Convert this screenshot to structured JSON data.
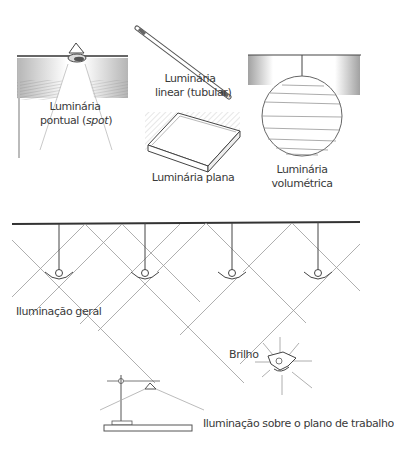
{
  "figure": {
    "type": "illustration"
  },
  "luminaires": [
    {
      "id": "spot",
      "line1": "Luminária",
      "line2_prefix": "pontual (",
      "line2_em": "spot",
      "line2_suffix": ")"
    },
    {
      "id": "linear",
      "line1": "Luminária",
      "line2": "linear (tubular)"
    },
    {
      "id": "plana",
      "line1": "Luminária plana"
    },
    {
      "id": "volumetrica",
      "line1": "Luminária",
      "line2": "volumétrica"
    }
  ],
  "lighting": {
    "geral": "Iluminação geral",
    "brilho": "Brilho",
    "plano_trabalho": "Iluminação sobre o plano de trabalho",
    "pendant_count": 4
  },
  "colors": {
    "ink": "#3a3a3a",
    "line": "#555555",
    "light_line": "#9a9a9a",
    "hatch": "#8a8a8a",
    "background": "#ffffff"
  }
}
